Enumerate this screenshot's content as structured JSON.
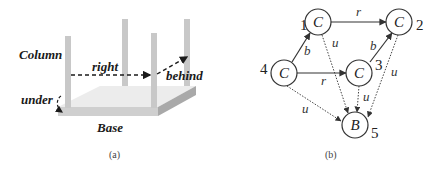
{
  "panel_a": {
    "caption": "(a)",
    "labels": {
      "column": "Column",
      "right": "right",
      "behind": "behind",
      "under": "under",
      "base": "Base"
    },
    "colors": {
      "column": "#c8c8c8",
      "base_top": "#ececec",
      "base_front": "#cfcfcf",
      "base_side": "#a9a9a9",
      "arrow": "#1a1a1a"
    }
  },
  "panel_b": {
    "caption": "(b)",
    "nodes": [
      {
        "id": "1",
        "label": "C",
        "num": "1"
      },
      {
        "id": "2",
        "label": "C",
        "num": "2"
      },
      {
        "id": "3",
        "label": "C",
        "num": "3"
      },
      {
        "id": "4",
        "label": "C",
        "num": "4"
      },
      {
        "id": "5",
        "label": "B",
        "num": "5"
      }
    ],
    "edges": [
      {
        "from": "1",
        "to": "2",
        "label": "r",
        "style": "solid"
      },
      {
        "from": "4",
        "to": "1",
        "label": "b",
        "style": "solid"
      },
      {
        "from": "4",
        "to": "3",
        "label": "r",
        "style": "solid"
      },
      {
        "from": "3",
        "to": "2",
        "label": "b",
        "style": "solid"
      },
      {
        "from": "1",
        "to": "5",
        "label": "u",
        "style": "dotted"
      },
      {
        "from": "2",
        "to": "5",
        "label": "u",
        "style": "dotted"
      },
      {
        "from": "3",
        "to": "5",
        "label": "u",
        "style": "dotted"
      },
      {
        "from": "4",
        "to": "5",
        "label": "u",
        "style": "dotted"
      }
    ]
  }
}
